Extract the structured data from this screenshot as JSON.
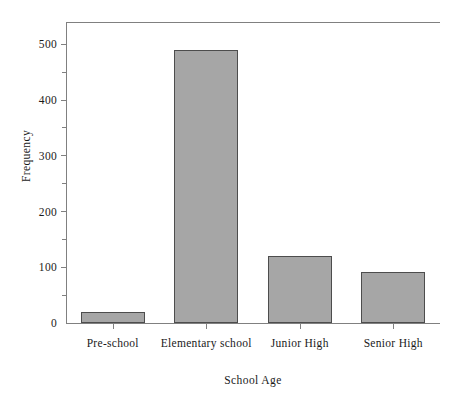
{
  "chart_data": {
    "type": "bar",
    "title": "",
    "categories": [
      "Pre-school",
      "Elementary school",
      "Junior High",
      "Senior High"
    ],
    "values": [
      20,
      490,
      120,
      92
    ],
    "xlabel": "School Age",
    "ylabel": "Frequency",
    "ylim": [
      0,
      540
    ],
    "yticks": [
      0,
      100,
      200,
      300,
      400,
      500
    ],
    "ytick_labels": [
      "0",
      "100",
      "200",
      "300",
      "400",
      "500"
    ],
    "yminor_ticks": [
      50,
      150,
      250,
      350,
      450
    ],
    "grid": false,
    "legend": false,
    "bar_fill_color": "#a6a6a6",
    "bar_edge_color": "#4d4d4d",
    "axis_color": "#808080",
    "background_color": "#ffffff"
  }
}
